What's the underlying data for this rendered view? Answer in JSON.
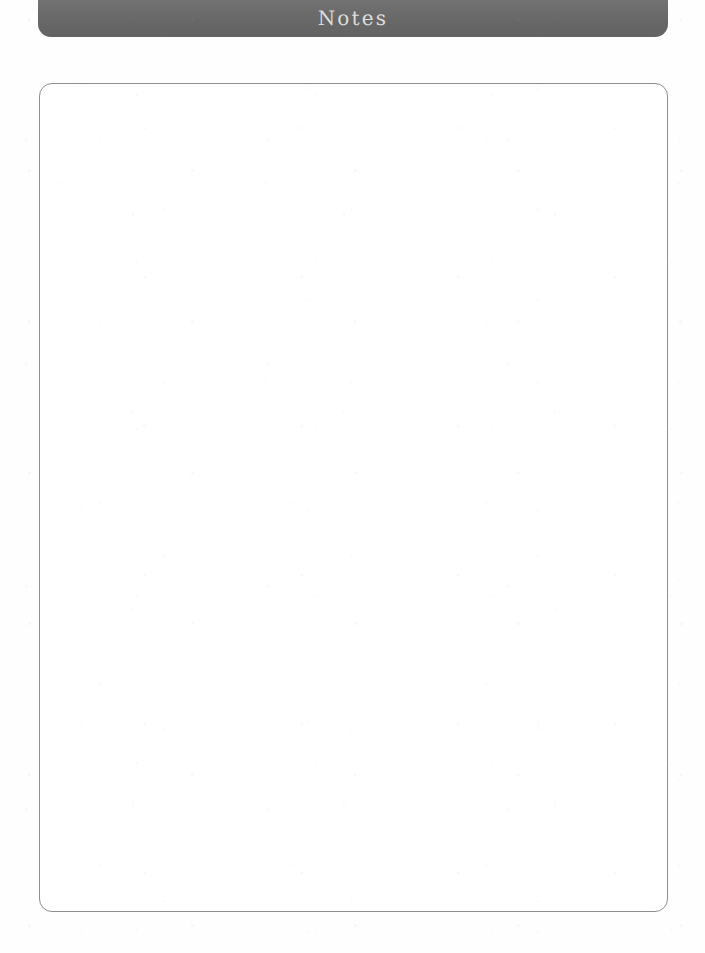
{
  "page": {
    "document_type": "notes-page",
    "background_color": "#ffffff"
  },
  "header": {
    "title": "Notes",
    "banner_color": "#6b6b6b",
    "title_color": "#dcdcdc"
  },
  "notes_box": {
    "content": "",
    "placeholder": "",
    "border_color": "#8e8e8e",
    "fill_color": "#ffffff"
  }
}
